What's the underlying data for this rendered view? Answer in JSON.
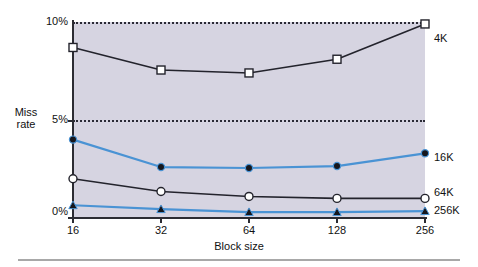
{
  "chart_data": {
    "type": "line",
    "title": "",
    "xlabel": "Block size",
    "ylabel": "Miss rate",
    "ylabel_lines": [
      "Miss",
      "rate"
    ],
    "x": [
      16,
      32,
      64,
      128,
      256
    ],
    "categories": [
      "16",
      "32",
      "64",
      "128",
      "256"
    ],
    "xtick_labels": [
      "16",
      "32",
      "64",
      "128",
      "256"
    ],
    "ytick_labels": [
      "0%",
      "5%",
      "10%"
    ],
    "yticks": [
      0,
      5,
      10
    ],
    "ylim": [
      0,
      10
    ],
    "grid": "horizontal-dotted",
    "legend_position": "right-end-of-line",
    "colors": {
      "series_dark": "#23232c",
      "series_blue": "#4a93d4",
      "plot_background": "#d6d4e1",
      "axis": "#2c2c33",
      "gridline": "#2a2a35",
      "page_background": "#ffffff"
    },
    "series": [
      {
        "name": "4K",
        "label": "4K",
        "color": "#23232c",
        "marker": "open-square",
        "values": [
          8.7,
          7.55,
          7.4,
          8.1,
          9.9
        ]
      },
      {
        "name": "16K",
        "label": "16K",
        "color": "#4a93d4",
        "marker": "filled-circle",
        "values": [
          4.0,
          2.6,
          2.55,
          2.65,
          3.3
        ]
      },
      {
        "name": "64K",
        "label": "64K",
        "color": "#23232c",
        "marker": "open-circle",
        "values": [
          2.0,
          1.35,
          1.1,
          1.0,
          1.0
        ]
      },
      {
        "name": "256K",
        "label": "256K",
        "color": "#4a93d4",
        "marker": "filled-triangle",
        "values": [
          0.65,
          0.45,
          0.3,
          0.3,
          0.35
        ]
      }
    ]
  }
}
